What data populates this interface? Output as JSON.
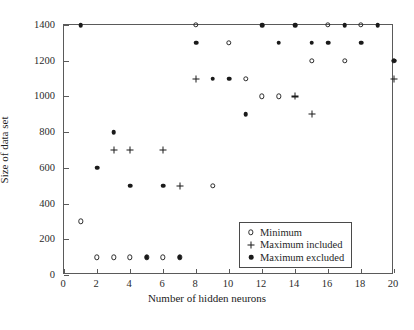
{
  "chart_data": {
    "type": "scatter",
    "title": "",
    "xlabel": "Number of hidden neurons",
    "ylabel": "Size of data set",
    "xlim": [
      0,
      20
    ],
    "ylim": [
      0,
      1400
    ],
    "xticks": [
      0,
      2,
      4,
      6,
      8,
      10,
      12,
      14,
      16,
      18,
      20
    ],
    "yticks": [
      0,
      200,
      400,
      600,
      800,
      1000,
      1200,
      1400
    ],
    "grid": false,
    "legend_position": "lower right",
    "series": [
      {
        "name": "Minimum",
        "marker": "open-circle",
        "color": "#1a1a1a",
        "points": [
          [
            1,
            300
          ],
          [
            2,
            100
          ],
          [
            3,
            100
          ],
          [
            4,
            100
          ],
          [
            5,
            100
          ],
          [
            6,
            100
          ],
          [
            7,
            100
          ],
          [
            8,
            1400
          ],
          [
            9,
            500
          ],
          [
            10,
            1300
          ],
          [
            11,
            1100
          ],
          [
            12,
            1000
          ],
          [
            13,
            1000
          ],
          [
            15,
            1200
          ],
          [
            16,
            1400
          ],
          [
            17,
            1200
          ],
          [
            18,
            1400
          ],
          [
            20,
            1200
          ]
        ]
      },
      {
        "name": "Maximum included",
        "marker": "plus",
        "color": "#1a1a1a",
        "points": [
          [
            3,
            700
          ],
          [
            4,
            700
          ],
          [
            6,
            700
          ],
          [
            7,
            500
          ],
          [
            8,
            1100
          ],
          [
            14,
            1000
          ],
          [
            15,
            900
          ],
          [
            20,
            1100
          ]
        ]
      },
      {
        "name": "Maximum excluded",
        "marker": "filled-dot",
        "color": "#1a1a1a",
        "points": [
          [
            1,
            1400
          ],
          [
            2,
            600
          ],
          [
            3,
            800
          ],
          [
            4,
            500
          ],
          [
            5,
            100
          ],
          [
            6,
            500
          ],
          [
            7,
            100
          ],
          [
            8,
            1300
          ],
          [
            9,
            1100
          ],
          [
            10,
            1100
          ],
          [
            11,
            900
          ],
          [
            12,
            1400
          ],
          [
            13,
            1300
          ],
          [
            14,
            1400
          ],
          [
            15,
            1300
          ],
          [
            16,
            1300
          ],
          [
            17,
            1400
          ],
          [
            18,
            1300
          ],
          [
            19,
            1400
          ],
          [
            20,
            1200
          ]
        ]
      }
    ]
  },
  "legend": {
    "items": [
      {
        "label": "Minimum",
        "marker": "open-circle"
      },
      {
        "label": "Maximum included",
        "marker": "plus"
      },
      {
        "label": "Maximum excluded",
        "marker": "filled-dot"
      }
    ]
  },
  "axes": {
    "x_title": "Number of hidden neurons",
    "y_title": "Size of data set",
    "x_tick_labels": [
      "0",
      "2",
      "4",
      "6",
      "8",
      "10",
      "12",
      "14",
      "16",
      "18",
      "20"
    ],
    "y_tick_labels": [
      "0",
      "200",
      "400",
      "600",
      "800",
      "1000",
      "1200",
      "1400"
    ]
  }
}
